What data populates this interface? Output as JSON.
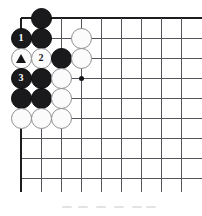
{
  "figure": {
    "kind": "go-board-diagram",
    "title": "",
    "caption": "",
    "colors": {
      "black_stone": "#1a1a1c",
      "white_stone": "#fbfbfb",
      "white_stone_border": "#8e8e93",
      "grid_line": "#55545a",
      "board_edge": "#1d1d1f",
      "star_point": "#131316",
      "background": "#ffffff",
      "black_label_text": "#ffffff",
      "white_label_text": "#16161a"
    }
  },
  "board": {
    "origin_x": 21,
    "origin_y": 18,
    "spacing": 20,
    "columns": 9,
    "rows": 9,
    "top_edge_row": 1,
    "left_edge_column": 1,
    "star_points": [
      {
        "col": 4,
        "row": 4
      }
    ]
  },
  "stones": [
    {
      "col": 2,
      "row": 1,
      "color": "black",
      "label": "",
      "mark": ""
    },
    {
      "col": 1,
      "row": 2,
      "color": "black",
      "label": "1",
      "mark": "number"
    },
    {
      "col": 2,
      "row": 2,
      "color": "black",
      "label": "",
      "mark": ""
    },
    {
      "col": 4,
      "row": 2,
      "color": "white",
      "label": "",
      "mark": ""
    },
    {
      "col": 1,
      "row": 3,
      "color": "white",
      "label": "",
      "mark": "triangle"
    },
    {
      "col": 2,
      "row": 3,
      "color": "white",
      "label": "2",
      "mark": "number"
    },
    {
      "col": 3,
      "row": 3,
      "color": "black",
      "label": "",
      "mark": ""
    },
    {
      "col": 4,
      "row": 3,
      "color": "white",
      "label": "",
      "mark": ""
    },
    {
      "col": 1,
      "row": 4,
      "color": "black",
      "label": "3",
      "mark": "number"
    },
    {
      "col": 2,
      "row": 4,
      "color": "black",
      "label": "",
      "mark": ""
    },
    {
      "col": 3,
      "row": 4,
      "color": "white",
      "label": "",
      "mark": ""
    },
    {
      "col": 1,
      "row": 5,
      "color": "black",
      "label": "",
      "mark": ""
    },
    {
      "col": 2,
      "row": 5,
      "color": "black",
      "label": "",
      "mark": ""
    },
    {
      "col": 3,
      "row": 5,
      "color": "white",
      "label": "",
      "mark": ""
    },
    {
      "col": 1,
      "row": 6,
      "color": "white",
      "label": "",
      "mark": ""
    },
    {
      "col": 2,
      "row": 6,
      "color": "white",
      "label": "",
      "mark": ""
    },
    {
      "col": 3,
      "row": 6,
      "color": "white",
      "label": "",
      "mark": ""
    }
  ],
  "move_sequence": [
    {
      "label": "1",
      "color": "black"
    },
    {
      "label": "2",
      "color": "white"
    },
    {
      "label": "3",
      "color": "black"
    }
  ],
  "marked_stones": [
    {
      "mark": "triangle",
      "color": "white"
    }
  ]
}
